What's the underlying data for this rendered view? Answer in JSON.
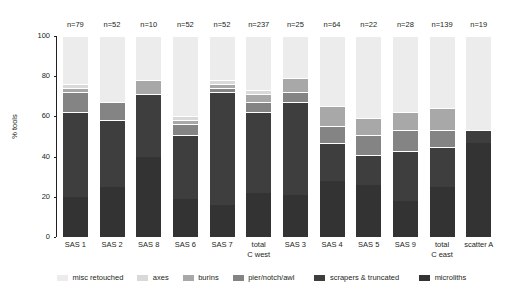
{
  "chart_data": {
    "type": "bar",
    "subtype": "stacked-bar-percent",
    "title": "",
    "xlabel": "",
    "ylabel": "% tools",
    "ylim": [
      0,
      100
    ],
    "yticks": [
      0,
      20,
      40,
      60,
      80,
      100
    ],
    "grid": false,
    "legend_position": "bottom",
    "stack_order_bottom_to_top": [
      "microliths",
      "scrapers & truncated",
      "pier/notch/awl",
      "burins",
      "axes",
      "misc retouched"
    ],
    "categories": [
      "SAS 1",
      "SAS 2",
      "SAS 8",
      "SAS 6",
      "SAS 7",
      "total\nC west",
      "SAS 3",
      "SAS 4",
      "SAS 5",
      "SAS 9",
      "total\nC east",
      "scatter A"
    ],
    "counts": [
      "n=79",
      "n=52",
      "n=10",
      "n=52",
      "n=52",
      "n=237",
      "n=25",
      "n=64",
      "n=22",
      "n=28",
      "n=139",
      "n=19"
    ],
    "colors": {
      "misc retouched": "#ececec",
      "axes": "#d9d9d9",
      "burins": "#a8a8a8",
      "pier/notch/awl": "#848484",
      "scrapers & truncated": "#3e3e3e",
      "microliths": "#333333"
    },
    "series": [
      {
        "name": "microliths",
        "values": [
          20,
          25,
          40,
          19,
          16,
          22,
          21,
          28,
          26,
          18,
          25,
          47
        ]
      },
      {
        "name": "scrapers & truncated",
        "values": [
          42,
          33,
          31,
          32,
          56,
          40,
          46,
          19,
          15,
          25,
          20,
          6
        ]
      },
      {
        "name": "pier/notch/awl",
        "values": [
          10,
          9,
          0,
          5,
          2,
          5,
          5,
          8,
          10,
          10,
          8,
          0
        ]
      },
      {
        "name": "burins",
        "values": [
          2,
          0,
          7,
          2,
          2,
          4,
          7,
          10,
          8,
          9,
          11,
          0
        ]
      },
      {
        "name": "axes",
        "values": [
          2,
          0,
          0,
          2,
          2,
          2,
          0,
          0,
          0,
          0,
          0,
          0
        ]
      },
      {
        "name": "misc retouched",
        "values": [
          24,
          33,
          22,
          40,
          22,
          27,
          21,
          35,
          41,
          38,
          36,
          47
        ]
      }
    ]
  },
  "legend": {
    "items": [
      {
        "label": "misc retouched",
        "color": "#ececec"
      },
      {
        "label": "axes",
        "color": "#d9d9d9"
      },
      {
        "label": "burins",
        "color": "#a8a8a8"
      },
      {
        "label": "pier/notch/awl",
        "color": "#848484"
      },
      {
        "label": "scrapers & truncated",
        "color": "#3e3e3e"
      },
      {
        "label": "microliths",
        "color": "#333333"
      }
    ]
  }
}
